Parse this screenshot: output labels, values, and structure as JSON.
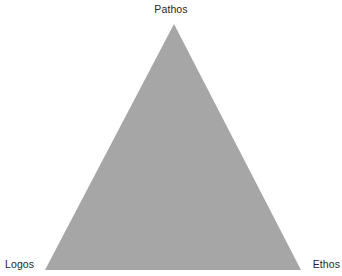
{
  "diagram": {
    "type": "rhetorical-triangle",
    "background_color": "#ffffff",
    "shape": {
      "name": "triangle",
      "fill_color": "#a6a6a6",
      "stroke_color": "none",
      "points": "174,24 301,270 45,270"
    },
    "labels": {
      "top": "Pathos",
      "bottom_left": "Logos",
      "bottom_right": "Ethos"
    },
    "label_color": "#262626"
  }
}
